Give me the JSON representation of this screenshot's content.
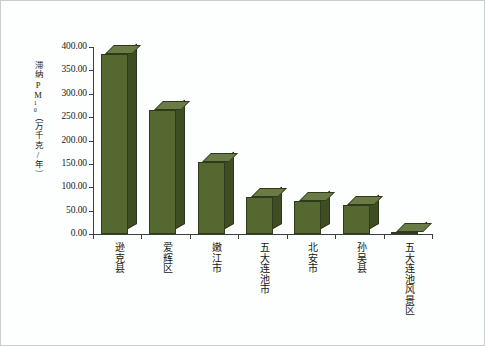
{
  "chart": {
    "type": "bar",
    "y_axis_title": "滞纳PM",
    "y_axis_title_sub": "10",
    "y_axis_title_unit": "（万千克/年）",
    "y_ticks": [
      "400.00",
      "350.00",
      "300.00",
      "250.00",
      "200.00",
      "150.00",
      "100.00",
      "50.00",
      "0.00"
    ]
  },
  "chart_data": {
    "type": "bar",
    "title": "",
    "xlabel": "",
    "ylabel": "滞纳PM10（万千克/年）",
    "ylim": [
      0,
      400
    ],
    "yticks": [
      0,
      50,
      100,
      150,
      200,
      250,
      300,
      350,
      400
    ],
    "grid": false,
    "legend": "none",
    "bar_style": "3d-column",
    "bar_color": "#55682f",
    "bar_top_color": "#6a7c45",
    "bar_side_color": "#3f4e22",
    "categories": [
      "逊克县",
      "爱辉区",
      "嫩江市",
      "五大连池市",
      "北安市",
      "孙吴县",
      "五大连池风景区"
    ],
    "values": [
      385.0,
      265.0,
      155.0,
      80.0,
      70.0,
      62.0,
      5.0
    ]
  },
  "categories": [
    {
      "label": "逊克县"
    },
    {
      "label": "爱辉区"
    },
    {
      "label": "嫩江市"
    },
    {
      "label": "五大连池市"
    },
    {
      "label": "北安市"
    },
    {
      "label": "孙吴县"
    },
    {
      "label": "五大连池风景区"
    }
  ]
}
